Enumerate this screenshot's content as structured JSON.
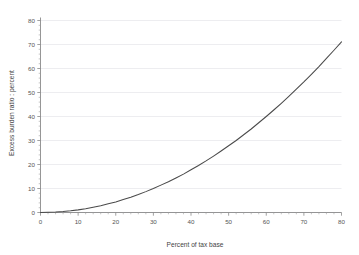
{
  "chart_data": {
    "type": "line",
    "title": "",
    "subtitle": "",
    "xlabel": "Percent of tax base",
    "ylabel": "Excess burden ratio : percent",
    "xlim": [
      0,
      80
    ],
    "ylim": [
      0,
      80
    ],
    "xticks": [
      0,
      10,
      20,
      30,
      40,
      50,
      60,
      70,
      80
    ],
    "yticks": [
      0,
      10,
      20,
      30,
      40,
      50,
      60,
      70,
      80
    ],
    "xtick_labels": [
      "0",
      "10",
      "20",
      "30",
      "40",
      "50",
      "60",
      "70",
      "80"
    ],
    "ytick_labels": [
      "0",
      "10",
      "20",
      "30",
      "40",
      "50",
      "60",
      "70",
      "80"
    ],
    "x_minor_tick_step": 2,
    "y_minor_tick_step": 2,
    "grid": {
      "horizontal": true,
      "vertical": false,
      "color": "#e9e9ec"
    },
    "legend": {
      "visible": false,
      "position": "none",
      "entries": []
    },
    "annotations": [],
    "series": [
      {
        "name": "Excess burden ratio",
        "color": "#4a4a4a",
        "x": [
          0,
          2,
          4,
          6,
          8,
          10,
          12,
          14,
          16,
          18,
          20,
          22,
          24,
          26,
          28,
          30,
          32,
          34,
          36,
          38,
          40,
          42,
          44,
          46,
          48,
          50,
          52,
          54,
          56,
          58,
          60,
          62,
          64,
          66,
          68,
          70,
          72,
          74,
          76,
          78,
          80
        ],
        "values": [
          0.0,
          0.1,
          0.2,
          0.4,
          0.7,
          1.1,
          1.6,
          2.2,
          2.8,
          3.6,
          4.4,
          5.4,
          6.4,
          7.5,
          8.7,
          10.0,
          11.4,
          12.8,
          14.4,
          16.0,
          17.8,
          19.6,
          21.5,
          23.5,
          25.6,
          27.8,
          30.0,
          32.4,
          34.8,
          37.4,
          40.0,
          42.7,
          45.5,
          48.4,
          51.4,
          54.4,
          57.6,
          60.8,
          64.2,
          67.6,
          71.1
        ]
      }
    ]
  },
  "axes": {
    "x_axis_label": "Percent of tax base",
    "y_axis_label": "Excess burden ratio : percent"
  }
}
